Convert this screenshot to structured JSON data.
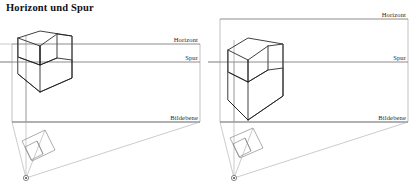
{
  "document": {
    "title": "Horizont und Spur"
  },
  "panels": [
    {
      "id": "left",
      "name": "perspective-low-horizon",
      "labels": {
        "horizont": "Horizont",
        "spur": "Spur",
        "bildebene": "Bildebene"
      },
      "label_positions": {
        "horizont": {
          "x": 198,
          "y": 36
        },
        "spur": {
          "x": 198,
          "y": 54
        },
        "bildebene": {
          "x": 198,
          "y": 114
        }
      },
      "lines": {
        "horizont_y": 44,
        "spur_y": 62,
        "bildebene_y": 122
      },
      "frame": {
        "x": 12,
        "y": 44,
        "width": 188,
        "height": 78
      },
      "viewpoint": {
        "x": 26,
        "y": 178
      }
    },
    {
      "id": "right",
      "name": "perspective-high-horizon",
      "labels": {
        "horizont": "Horizont",
        "spur": "Spur",
        "bildebene": "Bildebene"
      },
      "label_positions": {
        "horizont": {
          "x": 406,
          "y": 11
        },
        "spur": {
          "x": 406,
          "y": 54
        },
        "bildebene": {
          "x": 406,
          "y": 114
        }
      },
      "lines": {
        "horizont_y": 19,
        "spur_y": 62,
        "bildebene_y": 122
      },
      "frame": {
        "x": 220,
        "y": 19,
        "width": 188,
        "height": 103
      },
      "viewpoint": {
        "x": 234,
        "y": 178
      }
    }
  ],
  "colors": {
    "object_stroke": "#1d1d1d",
    "construction_line": "#8c8c8c",
    "frame_line": "#a0a0a0",
    "label_text": "#2b2b2b",
    "title_text": "#111111",
    "background": "#ffffff"
  },
  "icons": {
    "viewpoint": "eye-point-marker"
  }
}
